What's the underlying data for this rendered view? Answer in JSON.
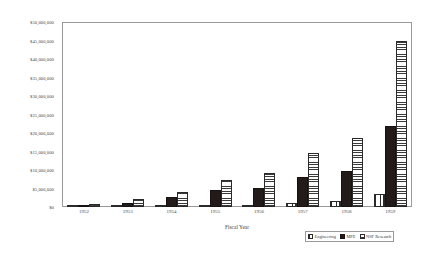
{
  "chart_data": {
    "type": "bar",
    "title": "",
    "subtitle": "",
    "xlabel": "Fiscal Year",
    "ylabel": "",
    "categories": [
      "1952",
      "1953",
      "1954",
      "1955",
      "1956",
      "1957",
      "1958",
      "1959"
    ],
    "ylim": [
      0,
      50000000
    ],
    "ytick_values": [
      0,
      5000000,
      10000000,
      15000000,
      20000000,
      25000000,
      30000000,
      35000000,
      40000000,
      45000000,
      50000000
    ],
    "ytick_labels": [
      "$0",
      "$5,000,000",
      "$10,000,000",
      "$15,000,000",
      "$20,000,000",
      "$25,000,000",
      "$30,000,000",
      "$35,000,000",
      "$40,000,000",
      "$45,000,000",
      "$50,000,000"
    ],
    "grid": false,
    "legend_position": "bottom-right",
    "series": [
      {
        "name": "Engineering",
        "pattern": "vertical-hatch",
        "values": [
          100000,
          150000,
          250000,
          400000,
          500000,
          1100000,
          1600000,
          3500000
        ]
      },
      {
        "name": "MPE",
        "pattern": "solid-black",
        "values": [
          400000,
          1200000,
          2600000,
          4700000,
          5200000,
          8000000,
          9800000,
          22000000
        ]
      },
      {
        "name": "NSF Research",
        "pattern": "horizontal-hatch",
        "values": [
          900000,
          2200000,
          4100000,
          7400000,
          9200000,
          14700000,
          18700000,
          45000000
        ]
      }
    ]
  },
  "legend": {
    "entries": [
      {
        "label": "Engineering"
      },
      {
        "label": "MPE"
      },
      {
        "label": "NSF Research"
      }
    ]
  },
  "axes": {
    "x_title": "Fiscal Year"
  }
}
